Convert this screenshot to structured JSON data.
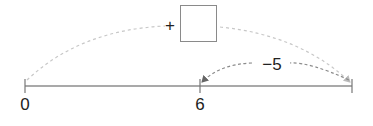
{
  "diagram": {
    "type": "number-line-jumps",
    "number_line": {
      "ticks": [
        {
          "label": "0",
          "x": 25
        },
        {
          "label": "6",
          "x": 200
        },
        {
          "label": "",
          "x": 352
        }
      ]
    },
    "jumps": [
      {
        "from": "0",
        "to": "right end",
        "operator": "+",
        "value_box": "",
        "style": "dashed-light"
      },
      {
        "from": "right end",
        "to": "6",
        "label": "−5",
        "style": "dashed-dark"
      }
    ],
    "plus_sign": "+",
    "minus_label": "−5",
    "colors": {
      "line": "#8c8c8c",
      "arc_light": "#c8c8c8",
      "arc_dark": "#8c8c8c",
      "text": "#222222"
    }
  }
}
